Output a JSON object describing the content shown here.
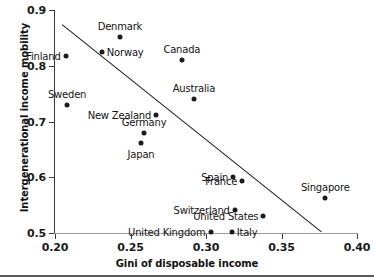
{
  "chart_data": {
    "type": "scatter",
    "title": "",
    "xlabel": "Gini of disposable income",
    "ylabel": "Intergenerational income mobility",
    "xlim": [
      0.2,
      0.4
    ],
    "ylim": [
      0.5,
      0.9
    ],
    "xticks": [
      "0.20",
      "0.25",
      "0.30",
      "0.35",
      "0.40"
    ],
    "xtick_values": [
      0.2,
      0.25,
      0.3,
      0.35,
      0.4
    ],
    "yticks": [
      "0.5",
      "0.6",
      "0.7",
      "0.8",
      "0.9"
    ],
    "ytick_values": [
      0.5,
      0.6,
      0.7,
      0.8,
      0.9
    ],
    "grid": false,
    "legend": "none",
    "marker_color": "#1c1c1c",
    "line_color": "#1c1c1c",
    "points": [
      {
        "label": "Finland",
        "x": 0.207,
        "y": 0.817,
        "label_pos": "left"
      },
      {
        "label": "Denmark",
        "x": 0.243,
        "y": 0.851,
        "label_pos": "above"
      },
      {
        "label": "Norway",
        "x": 0.231,
        "y": 0.824,
        "label_pos": "right"
      },
      {
        "label": "Canada",
        "x": 0.284,
        "y": 0.81,
        "label_pos": "above"
      },
      {
        "label": "Sweden",
        "x": 0.208,
        "y": 0.729,
        "label_pos": "above"
      },
      {
        "label": "Australia",
        "x": 0.292,
        "y": 0.741,
        "label_pos": "above"
      },
      {
        "label": "New Zealand",
        "x": 0.267,
        "y": 0.712,
        "label_pos": "left"
      },
      {
        "label": "Germany",
        "x": 0.259,
        "y": 0.68,
        "label_pos": "above"
      },
      {
        "label": "Japan",
        "x": 0.257,
        "y": 0.662,
        "label_pos": "below"
      },
      {
        "label": "Spain",
        "x": 0.318,
        "y": 0.601,
        "label_pos": "left"
      },
      {
        "label": "France",
        "x": 0.324,
        "y": 0.593,
        "label_pos": "left"
      },
      {
        "label": "Singapore",
        "x": 0.379,
        "y": 0.563,
        "label_pos": "above"
      },
      {
        "label": "Switzerland",
        "x": 0.319,
        "y": 0.541,
        "label_pos": "left"
      },
      {
        "label": "United States",
        "x": 0.338,
        "y": 0.531,
        "label_pos": "left"
      },
      {
        "label": "United Kingdom",
        "x": 0.303,
        "y": 0.502,
        "label_pos": "left"
      },
      {
        "label": "Italy",
        "x": 0.317,
        "y": 0.502,
        "label_pos": "right"
      }
    ],
    "trendline": {
      "x0": 0.2045,
      "y0": 0.8755,
      "x1": 0.376,
      "y1": 0.504
    }
  }
}
